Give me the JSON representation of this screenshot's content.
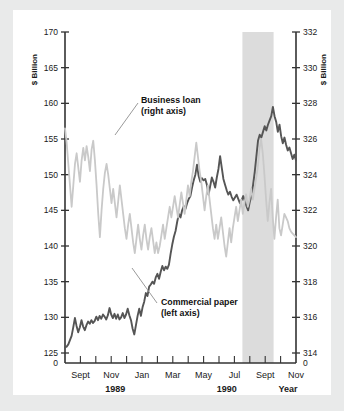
{
  "figure": {
    "background": "#ffffff",
    "page_background": "#e9eaea"
  },
  "chart_data": {
    "type": "line",
    "title": "",
    "xlabel": "Year",
    "left_axis": {
      "label": "$ Billion",
      "ticks": [
        125,
        130,
        135,
        140,
        145,
        150,
        155,
        160,
        165,
        170
      ],
      "zero_label": "0",
      "ylim": [
        125,
        170
      ]
    },
    "right_axis": {
      "label": "$ Billion",
      "ticks": [
        314,
        316,
        318,
        320,
        322,
        324,
        326,
        328,
        330,
        332
      ],
      "zero_label": "0",
      "ylim": [
        314,
        332
      ]
    },
    "x_tick_labels": [
      "Sept",
      "Nov",
      "Jan",
      "Mar",
      "May",
      "Jul",
      "Sept",
      "Nov"
    ],
    "x_group_labels": [
      "1989",
      "1990"
    ],
    "grid": false,
    "legend_position": "inline-annotations",
    "annotations": [
      {
        "name": "business-loan",
        "line1": "Business loan",
        "line2": "(right axis)",
        "color": "#c9c9c9"
      },
      {
        "name": "commercial-paper",
        "line1": "Commercial paper",
        "line2": "(left axis)",
        "color": "#555555"
      }
    ],
    "shaded_band": {
      "label": "",
      "color": "#dcdcdc",
      "x_start_frac": 0.768,
      "x_end_frac": 0.903
    },
    "series": [
      {
        "name": "Commercial paper (left axis)",
        "axis": "left",
        "color": "#555555",
        "values": [
          125.8,
          125.9,
          126.2,
          126.8,
          127.4,
          128.6,
          129.9,
          128.8,
          127.9,
          128.6,
          129.6,
          128.7,
          128.2,
          128.9,
          129.4,
          129.1,
          129.6,
          129.2,
          129.5,
          130.1,
          129.6,
          130.2,
          129.8,
          130.4,
          130.1,
          129.7,
          130.3,
          131.3,
          130.4,
          129.9,
          130.5,
          129.8,
          130.4,
          129.7,
          130.0,
          130.6,
          129.9,
          130.4,
          131.2,
          130.3,
          129.6,
          128.4,
          127.6,
          128.9,
          130.2,
          131.2,
          130.2,
          131.4,
          132.2,
          133.4,
          133.0,
          134.3,
          134.6,
          135.0,
          134.7,
          135.6,
          136.1,
          135.4,
          136.4,
          137.2,
          136.6,
          137.1,
          136.8,
          137.4,
          138.9,
          140.2,
          141.3,
          142.1,
          143.4,
          144.5,
          144.0,
          145.0,
          145.6,
          145.2,
          146.0,
          146.6,
          147.0,
          148.2,
          149.2,
          150.0,
          151.4,
          149.8,
          149.0,
          149.5,
          149.2,
          149.4,
          148.6,
          147.2,
          148.4,
          149.6,
          149.0,
          148.2,
          149.6,
          150.8,
          152.6,
          151.0,
          149.4,
          148.6,
          147.8,
          147.2,
          147.6,
          146.9,
          146.4,
          146.8,
          147.2,
          146.6,
          146.0,
          146.4,
          147.0,
          146.3,
          145.6,
          145.0,
          146.2,
          147.0,
          148.6,
          150.4,
          152.6,
          154.8,
          155.6,
          155.2,
          156.0,
          156.8,
          156.2,
          157.0,
          157.6,
          158.2,
          159.5,
          158.2,
          157.4,
          156.0,
          157.0,
          155.4,
          154.4,
          155.2,
          154.2,
          153.4,
          153.8,
          153.0,
          152.2,
          152.8,
          152.0
        ]
      },
      {
        "name": "Business loan (right axis)",
        "axis": "right",
        "color": "#c9c9c9",
        "values": [
          326.6,
          325.8,
          324.6,
          323.4,
          322.2,
          323.4,
          324.6,
          325.2,
          324.4,
          323.6,
          324.8,
          325.5,
          324.8,
          325.6,
          325.0,
          324.2,
          325.4,
          325.9,
          324.8,
          323.4,
          321.8,
          320.5,
          322.0,
          323.2,
          324.1,
          324.6,
          324.0,
          323.2,
          322.4,
          323.2,
          322.4,
          321.6,
          322.5,
          323.4,
          322.6,
          321.8,
          321.0,
          320.4,
          321.2,
          321.8,
          321.0,
          320.2,
          319.6,
          320.4,
          321.2,
          320.4,
          319.8,
          320.6,
          321.2,
          320.4,
          319.8,
          320.5,
          321.0,
          320.3,
          319.6,
          320.2,
          319.6,
          320.0,
          320.6,
          321.2,
          320.4,
          321.0,
          321.6,
          322.2,
          321.6,
          322.2,
          322.8,
          322.2,
          321.6,
          322.3,
          323.0,
          322.4,
          321.8,
          322.6,
          323.4,
          322.8,
          323.6,
          324.2,
          325.0,
          325.8,
          325.0,
          324.2,
          323.6,
          322.8,
          322.0,
          322.8,
          323.4,
          322.6,
          321.8,
          321.0,
          320.4,
          321.2,
          320.4,
          321.0,
          321.6,
          320.8,
          320.0,
          319.4,
          320.2,
          321.0,
          320.2,
          321.0,
          321.6,
          322.2,
          321.4,
          322.0,
          322.6,
          321.8,
          322.4,
          322.9,
          322.2,
          322.6,
          323.2,
          322.6,
          323.2,
          323.8,
          324.4,
          325.4,
          326.0,
          325.2,
          324.0,
          322.6,
          321.4,
          322.4,
          323.2,
          321.6,
          320.4,
          321.6,
          322.6,
          321.0,
          320.6,
          321.2,
          321.8,
          321.6,
          321.4,
          321.0,
          320.8,
          320.7,
          320.6,
          320.5
        ]
      }
    ]
  }
}
